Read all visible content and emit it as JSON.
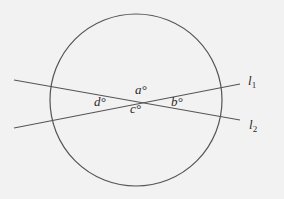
{
  "diagram": {
    "type": "geometry",
    "circle": {
      "cx": 136,
      "cy": 100,
      "r": 86,
      "stroke": "#555555"
    },
    "lines": [
      {
        "name": "l",
        "subscript": "1",
        "x1": 14,
        "y1": 128,
        "x2": 240,
        "y2": 84
      },
      {
        "name": "l",
        "subscript": "2",
        "x1": 14,
        "y1": 80,
        "x2": 240,
        "y2": 120
      }
    ],
    "angles": [
      {
        "label": "a°",
        "position": "top"
      },
      {
        "label": "b°",
        "position": "right"
      },
      {
        "label": "c°",
        "position": "bottom"
      },
      {
        "label": "d°",
        "position": "left"
      }
    ]
  }
}
